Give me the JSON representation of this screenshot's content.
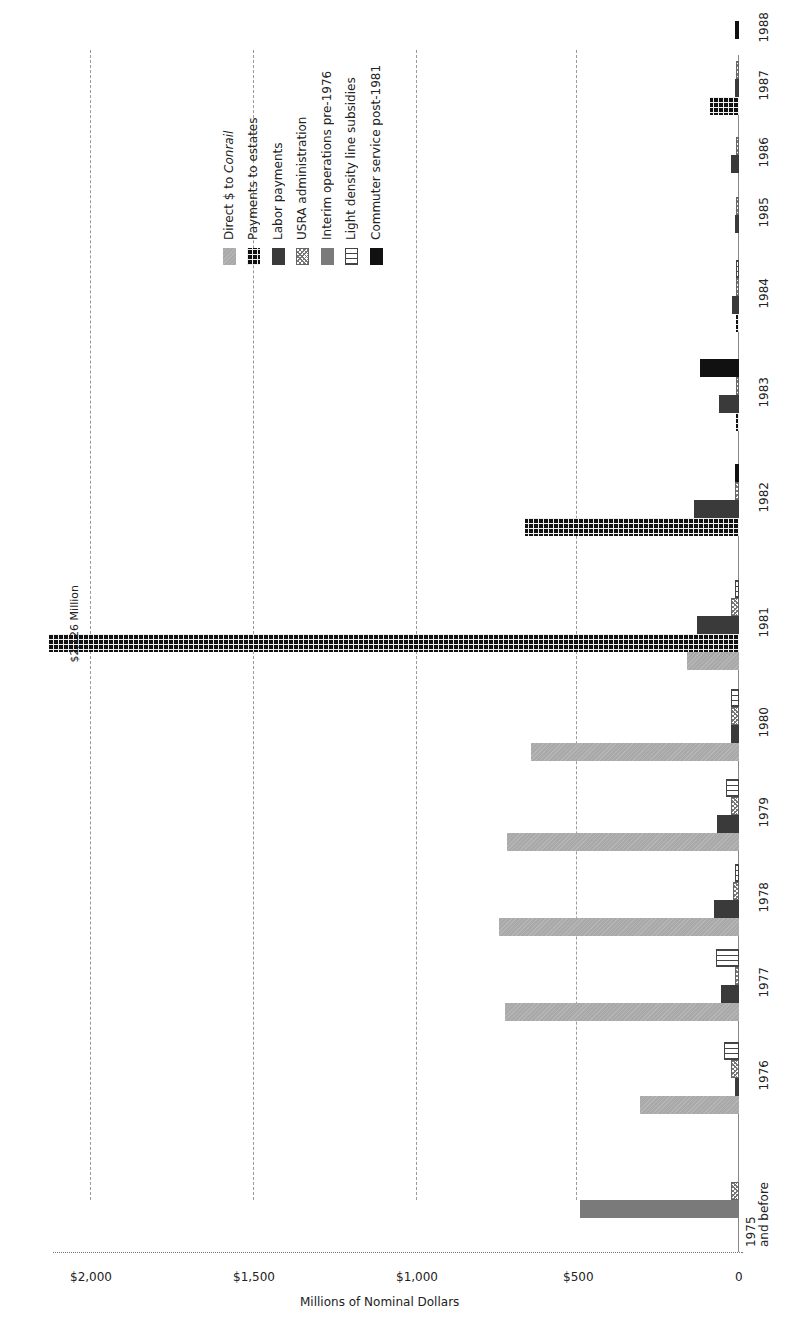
{
  "chart_data": {
    "type": "bar",
    "orientation": "rotated-90-clockwise (vertical bars, page rotated)",
    "title": "",
    "xlabel": "",
    "ylabel": "Millions of Nominal Dollars",
    "ylim": [
      0,
      2150
    ],
    "yticks": [
      {
        "value": 0,
        "label": "0"
      },
      {
        "value": 500,
        "label": "$500"
      },
      {
        "value": 1000,
        "label": "$1,000"
      },
      {
        "value": 1500,
        "label": "$1,500"
      },
      {
        "value": 2000,
        "label": "$2,000"
      }
    ],
    "grid": true,
    "legend_position": "upper-right (in rotated frame)",
    "categories": [
      "1975 and before",
      "1976",
      "1977",
      "1978",
      "1979",
      "1980",
      "1981",
      "1982",
      "1983",
      "1984",
      "1985",
      "1986",
      "1987",
      "1988"
    ],
    "series": [
      {
        "name": "Direct $ to Conrail",
        "key": "direct",
        "values": [
          0,
          305,
          720,
          740,
          715,
          640,
          160,
          0,
          0,
          0,
          0,
          0,
          0,
          0
        ]
      },
      {
        "name": "Payments to estates",
        "key": "estates",
        "values": [
          0,
          0,
          0,
          0,
          0,
          0,
          2126,
          660,
          10,
          10,
          0,
          0,
          88,
          0
        ]
      },
      {
        "name": "Labor payments",
        "key": "labor",
        "values": [
          0,
          12,
          55,
          77,
          68,
          25,
          130,
          140,
          62,
          22,
          12,
          25,
          12,
          0
        ]
      },
      {
        "name": "USRA administration",
        "key": "usra",
        "values": [
          25,
          25,
          12,
          20,
          25,
          25,
          25,
          12,
          6,
          8,
          8,
          8,
          8,
          0
        ]
      },
      {
        "name": "Interim operations pre-1976",
        "key": "interim",
        "values": [
          490,
          0,
          0,
          0,
          0,
          0,
          0,
          0,
          0,
          0,
          0,
          0,
          0,
          0
        ]
      },
      {
        "name": "Light density line subsidies",
        "key": "light",
        "values": [
          0,
          45,
          70,
          12,
          40,
          25,
          12,
          0,
          0,
          8,
          0,
          0,
          0,
          0
        ]
      },
      {
        "name": "Commuter service post-1981",
        "key": "commuter",
        "values": [
          0,
          0,
          0,
          0,
          0,
          0,
          0,
          12,
          120,
          0,
          0,
          0,
          0,
          12
        ]
      }
    ],
    "annotations": [
      {
        "text": "$2,126 Million",
        "category": "1981",
        "series": "Payments to estates"
      }
    ]
  },
  "axis": {
    "ylabel": "Millions of Nominal Dollars",
    "ticks": [
      "0",
      "$500",
      "$1,000",
      "$1,500",
      "$2,000"
    ]
  },
  "years": [
    {
      "l1": "1975",
      "l2": "and before"
    },
    {
      "l1": "1976",
      "l2": ""
    },
    {
      "l1": "1977",
      "l2": ""
    },
    {
      "l1": "1978",
      "l2": ""
    },
    {
      "l1": "1979",
      "l2": ""
    },
    {
      "l1": "1980",
      "l2": ""
    },
    {
      "l1": "1981",
      "l2": ""
    },
    {
      "l1": "1982",
      "l2": ""
    },
    {
      "l1": "1983",
      "l2": ""
    },
    {
      "l1": "1984",
      "l2": ""
    },
    {
      "l1": "1985",
      "l2": ""
    },
    {
      "l1": "1986",
      "l2": ""
    },
    {
      "l1": "1987",
      "l2": ""
    },
    {
      "l1": "1988",
      "l2": ""
    }
  ],
  "annotation": "$2,126 Million",
  "legend": [
    {
      "pre": "Direct $ to ",
      "em": "Conrail",
      "cls": "p-direct"
    },
    {
      "pre": "Payments to estates",
      "em": "",
      "cls": "p-estates"
    },
    {
      "pre": "Labor payments",
      "em": "",
      "cls": "p-labor"
    },
    {
      "pre": "USRA administration",
      "em": "",
      "cls": "p-usra"
    },
    {
      "pre": "Interim operations pre-1976",
      "em": "",
      "cls": "p-interim"
    },
    {
      "pre": "Light density line subsidies",
      "em": "",
      "cls": "p-light"
    },
    {
      "pre": "Commuter service post-1981",
      "em": "",
      "cls": "p-commuter"
    }
  ]
}
